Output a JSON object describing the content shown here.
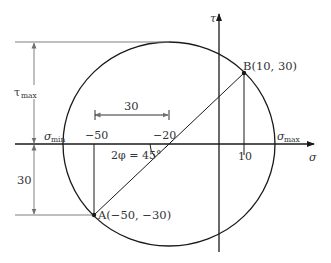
{
  "diagram": {
    "axes": {
      "x_label": "σ",
      "y_label": "τ"
    },
    "points": [
      {
        "id": "A",
        "label": "A(−50, −30)",
        "sigma": -50,
        "tau": -30
      },
      {
        "id": "B",
        "label": "B(10, 30)",
        "sigma": 10,
        "tau": 30
      }
    ],
    "center": {
      "sigma": -20,
      "tau": 0
    },
    "tick_labels": {
      "minus50": "−50",
      "minus20": "−20",
      "ten": "10"
    },
    "annotations": {
      "sigma_min": "σ",
      "sigma_min_sub": "min",
      "sigma_max": "σ",
      "sigma_max_sub": "max",
      "tau_max": "τ",
      "tau_max_sub": "max",
      "dim_30_horizontal": "30",
      "dim_30_vertical": "30",
      "angle": "2φ = 45°"
    },
    "colors": {
      "line": "#1a1a1a",
      "dimension": "#808080",
      "text": "#333333"
    }
  }
}
